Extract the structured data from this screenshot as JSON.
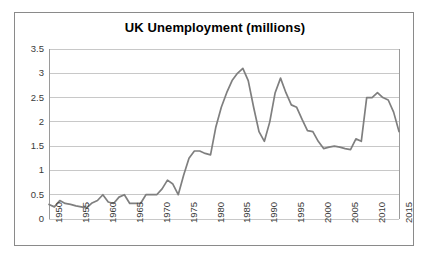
{
  "chart_data": {
    "type": "line",
    "title": "UK Unemployment (millions)",
    "xlabel": "",
    "ylabel": "",
    "xlim": [
      1950,
      2015
    ],
    "ylim": [
      0,
      3.5
    ],
    "grid": true,
    "legend": "none",
    "y_ticks": [
      "0",
      "0.5",
      "1",
      "1.5",
      "2",
      "2.5",
      "3",
      "3.5"
    ],
    "y_tick_values": [
      0,
      0.5,
      1,
      1.5,
      2,
      2.5,
      3,
      3.5
    ],
    "x_ticks": [
      "1950",
      "1955",
      "1960",
      "1965",
      "1970",
      "1975",
      "1980",
      "1985",
      "1990",
      "1995",
      "2000",
      "2005",
      "2010",
      "2015"
    ],
    "x_tick_values": [
      1950,
      1955,
      1960,
      1965,
      1970,
      1975,
      1980,
      1985,
      1990,
      1995,
      2000,
      2005,
      2010,
      2015
    ],
    "series": [
      {
        "name": "UK Unemployment",
        "color": "#7f7f7f",
        "x": [
          1950,
          1951,
          1952,
          1953,
          1954,
          1955,
          1956,
          1957,
          1958,
          1959,
          1960,
          1961,
          1962,
          1963,
          1964,
          1965,
          1966,
          1967,
          1968,
          1969,
          1970,
          1971,
          1972,
          1973,
          1974,
          1975,
          1976,
          1977,
          1978,
          1979,
          1980,
          1981,
          1982,
          1983,
          1984,
          1985,
          1986,
          1987,
          1988,
          1989,
          1990,
          1991,
          1992,
          1993,
          1994,
          1995,
          1996,
          1997,
          1998,
          1999,
          2000,
          2001,
          2002,
          2003,
          2004,
          2005,
          2006,
          2007,
          2008,
          2009,
          2010,
          2011,
          2012,
          2013,
          2014,
          2015
        ],
        "y": [
          0.3,
          0.25,
          0.38,
          0.32,
          0.3,
          0.27,
          0.25,
          0.23,
          0.33,
          0.38,
          0.5,
          0.35,
          0.32,
          0.45,
          0.5,
          0.32,
          0.32,
          0.32,
          0.5,
          0.5,
          0.5,
          0.62,
          0.8,
          0.72,
          0.5,
          0.9,
          1.25,
          1.4,
          1.4,
          1.35,
          1.32,
          1.9,
          2.3,
          2.6,
          2.85,
          3.0,
          3.1,
          2.85,
          2.3,
          1.8,
          1.6,
          2.0,
          2.6,
          2.9,
          2.6,
          2.35,
          2.3,
          2.05,
          1.82,
          1.8,
          1.6,
          1.45,
          1.48,
          1.5,
          1.48,
          1.45,
          1.43,
          1.65,
          1.6,
          2.5,
          2.5,
          2.6,
          2.5,
          2.45,
          2.2,
          1.8
        ]
      }
    ]
  },
  "axes": {
    "plot_left_px": 48,
    "plot_right_px": 398,
    "plot_top_px": 48,
    "plot_bottom_px": 218
  },
  "colors": {
    "line": "#7f7f7f",
    "grid": "#c8c8c8",
    "axis": "#9a9a9a",
    "frame": "#8a8a8a",
    "text": "#3a3a3a",
    "title": "#000000",
    "background": "#ffffff"
  }
}
